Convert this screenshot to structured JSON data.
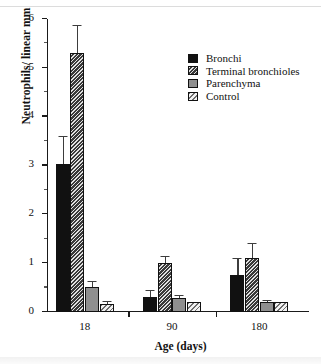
{
  "chart_data": {
    "type": "bar",
    "title": "",
    "xlabel": "Age (days)",
    "ylabel": "Neutrophils/ linear mm",
    "categories": [
      "18",
      "90",
      "180"
    ],
    "ylim": [
      0,
      6
    ],
    "yticks": [
      0,
      1,
      2,
      3,
      4,
      5,
      6
    ],
    "ytick_labels": [
      "0",
      "1",
      "2",
      "3",
      "4",
      "5",
      "6"
    ],
    "grid": false,
    "legend_position": "upper right",
    "series": [
      {
        "name": "Bronchi",
        "color": "#111111",
        "pattern": "solid",
        "values": [
          3.03,
          0.3,
          0.75
        ],
        "errors": [
          0.55,
          0.13,
          0.33
        ]
      },
      {
        "name": "Terminal bronchioles",
        "color": "#3a3a3a",
        "pattern": "dense-hatch",
        "values": [
          5.3,
          1.0,
          1.1
        ],
        "errors": [
          0.55,
          0.13,
          0.3
        ]
      },
      {
        "name": "Parenchyma",
        "color": "#8f8f8f",
        "pattern": "solid-gray",
        "values": [
          0.52,
          0.28,
          0.2
        ],
        "errors": [
          0.1,
          0.05,
          0.02
        ]
      },
      {
        "name": "Control",
        "color": "#f2f2f2",
        "pattern": "light-hatch",
        "values": [
          0.17,
          0.2,
          0.2
        ],
        "errors": [
          0.03,
          0.0,
          0.0
        ]
      }
    ]
  }
}
